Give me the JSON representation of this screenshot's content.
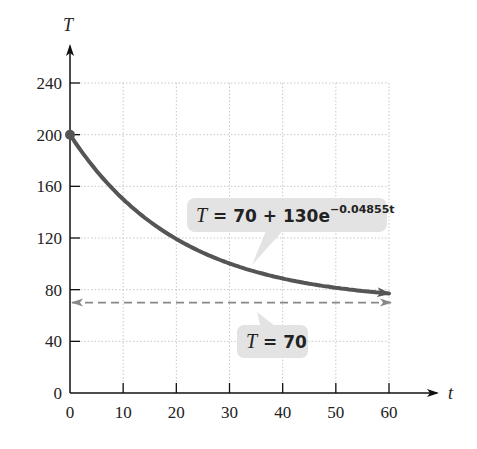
{
  "chart_data": {
    "type": "line",
    "title": "",
    "xlabel": "t",
    "ylabel": "T",
    "xlim": [
      0,
      60
    ],
    "ylim": [
      0,
      240
    ],
    "grid": true,
    "x_ticks": [
      "0",
      "10",
      "20",
      "30",
      "40",
      "50",
      "60"
    ],
    "y_ticks": [
      "0",
      "40",
      "80",
      "120",
      "160",
      "200",
      "240"
    ],
    "series": [
      {
        "name": "T = 70 + 130e^(-0.04855t)",
        "style": "solid",
        "color": "#555555",
        "x": [
          0,
          5,
          10,
          15,
          20,
          25,
          30,
          35,
          40,
          45,
          50,
          55,
          60
        ],
        "values": [
          200,
          172.2,
          150.3,
          131.3,
          116.5,
          103.2,
          94.3,
          87.0,
          81.7,
          77.6,
          74.2,
          71.9,
          77.0
        ]
      },
      {
        "name": "T = 70",
        "style": "dashed",
        "color": "#888888",
        "x": [
          0,
          60
        ],
        "values": [
          70,
          70
        ]
      }
    ],
    "annotations": [
      {
        "label_main": "T = 70 + 130e",
        "label_exp": "−0.04855t",
        "points_to": "curve"
      },
      {
        "label_main": "T = 70",
        "points_to": "asymptote"
      }
    ],
    "start_point": {
      "x": 0,
      "y": 200
    }
  },
  "labels": {
    "x_axis": "t",
    "y_axis": "T",
    "curve_eq_prefix_T": "T",
    "curve_eq_body": " = 70 + 130e",
    "curve_eq_exp": "−0.04855t",
    "asym_T": "T",
    "asym_body": " = 70"
  }
}
